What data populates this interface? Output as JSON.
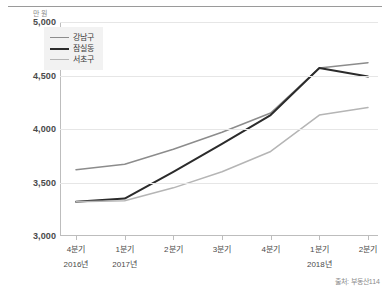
{
  "unit_label": "만 원",
  "source_note": "출처: 부동산114",
  "legend": {
    "items": [
      {
        "label": "강남구",
        "color": "#8c8c8c"
      },
      {
        "label": "잠실동",
        "color": "#2b2b2b"
      },
      {
        "label": "서초구",
        "color": "#b5b5b5"
      }
    ]
  },
  "axis": {
    "y_ticks": [
      "5,000",
      "4,500",
      "4,000",
      "3,500",
      "3,000"
    ],
    "x_quarter_labels": [
      "4분기",
      "1분기",
      "2분기",
      "3분기",
      "4분기",
      "1분기",
      "2분기"
    ],
    "x_year_labels": [
      {
        "label": "2016년",
        "at_index": 0
      },
      {
        "label": "2017년",
        "at_index": 1
      },
      {
        "label": "2018년",
        "at_index": 5
      }
    ]
  },
  "chart_data": {
    "type": "line",
    "title": "",
    "subtitle": "",
    "xlabel": "",
    "ylabel": "만 원",
    "categories": [
      "4분기",
      "1분기",
      "2분기",
      "3분기",
      "4분기",
      "1분기",
      "2분기"
    ],
    "category_years": [
      "2016년",
      "2017년",
      "2017년",
      "2017년",
      "2017년",
      "2018년",
      "2018년"
    ],
    "ylim": [
      3000,
      5000
    ],
    "y_ticks": [
      3000,
      3500,
      4000,
      4500,
      5000
    ],
    "grid": true,
    "legend_position": "top-left",
    "series": [
      {
        "name": "강남구",
        "color": "#8c8c8c",
        "values": [
          3620,
          3670,
          3810,
          3970,
          4150,
          4570,
          4620
        ]
      },
      {
        "name": "잠실동",
        "color": "#2b2b2b",
        "values": [
          3320,
          3350,
          3600,
          3860,
          4130,
          4570,
          4490
        ]
      },
      {
        "name": "서초구",
        "color": "#b5b5b5",
        "values": [
          3320,
          3330,
          3450,
          3600,
          3790,
          4130,
          4200
        ]
      }
    ]
  }
}
